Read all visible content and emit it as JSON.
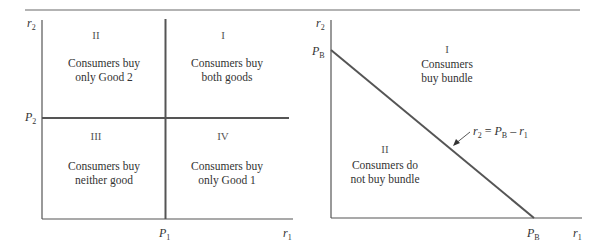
{
  "left_panel": {
    "y_axis_label": "r",
    "y_axis_sub": "2",
    "x_axis_label": "r",
    "x_axis_sub": "1",
    "price_y_label": "P",
    "price_y_sub": "2",
    "price_x_label": "P",
    "price_x_sub": "1",
    "regions": [
      {
        "numeral": "II",
        "line1": "Consumers buy",
        "line2": "only Good 2"
      },
      {
        "numeral": "I",
        "line1": "Consumers buy",
        "line2": "both goods"
      },
      {
        "numeral": "III",
        "line1": "Consumers buy",
        "line2": "neither good"
      },
      {
        "numeral": "IV",
        "line1": "Consumers buy",
        "line2": "only Good 1"
      }
    ]
  },
  "right_panel": {
    "y_axis_label": "r",
    "y_axis_sub": "2",
    "x_axis_label": "r",
    "x_axis_sub": "1",
    "price_y_label": "P",
    "price_y_sub": "B",
    "price_x_label": "P",
    "price_x_sub": "B",
    "line_equation": {
      "lhs": "r",
      "lhs_sub": "2",
      "eq": " = ",
      "p": "P",
      "p_sub": "B",
      "minus": " – ",
      "r": "r",
      "r_sub": "1"
    },
    "regions": [
      {
        "numeral": "I",
        "line1": "Consumers",
        "line2": "buy bundle"
      },
      {
        "numeral": "II",
        "line1": "Consumers do",
        "line2": "not buy bundle"
      }
    ]
  },
  "colors": {
    "axis": "#555555",
    "divider": "#555555",
    "rule": "#999999",
    "text": "#333333"
  }
}
